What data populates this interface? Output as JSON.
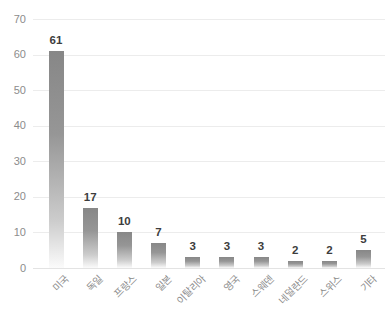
{
  "chart_data": {
    "type": "bar",
    "categories": [
      "미국",
      "독일",
      "프랑스",
      "일본",
      "이탈리아",
      "영국",
      "스웨덴",
      "네덜란드",
      "스위스",
      "기타"
    ],
    "values": [
      61,
      17,
      10,
      7,
      3,
      3,
      3,
      2,
      2,
      5
    ],
    "value_labels": [
      "61",
      "17",
      "10",
      "7",
      "3",
      "3",
      "3",
      "2",
      "2",
      "5"
    ],
    "title": "",
    "xlabel": "",
    "ylabel": "",
    "ylim": [
      0,
      70
    ],
    "yticks": [
      0,
      10,
      20,
      30,
      40,
      50,
      60,
      70
    ],
    "ytick_labels": [
      "0",
      "10",
      "20",
      "30",
      "40",
      "50",
      "60",
      "70"
    ],
    "grid": true,
    "legend": false,
    "colors": {
      "bar_gradient_top": "#878787",
      "bar_gradient_mid": "#969696",
      "bar_gradient_low": "#cccccc",
      "bar_gradient_bottom": "#fbfbfb",
      "value_label": "#3d3d3d",
      "axis_label": "#8c8c8c",
      "gridline": "#ececec",
      "baseline": "#e3e3e3",
      "background": "#ffffff"
    }
  }
}
